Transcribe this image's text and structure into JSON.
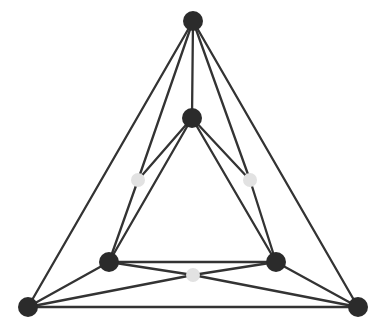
{
  "figure": {
    "width": 388,
    "height": 331,
    "background_color": "#ffffff"
  },
  "style": {
    "edge_color": "#333333",
    "edge_width": 2.3,
    "dark_vertex_color": "#2b2b2b",
    "light_vertex_color": "#e2e2e2",
    "light_vertex_stroke": "#d0d0d0",
    "dark_vertex_radius": 9.5,
    "light_vertex_radius": 7.0
  },
  "graph_data": {
    "type": "graph",
    "vertex_count": 9,
    "edge_count": 17,
    "vertices": [
      {
        "id": "apex",
        "label": "apex",
        "x": 193,
        "y": 21,
        "color": "dark",
        "radius": 10.0,
        "degree": 5
      },
      {
        "id": "inner-top",
        "label": "inner top",
        "x": 192,
        "y": 118,
        "color": "dark",
        "radius": 10.0,
        "degree": 5
      },
      {
        "id": "gray-left",
        "label": "left grey",
        "x": 138,
        "y": 180,
        "color": "light",
        "radius": 7.0,
        "degree": 2
      },
      {
        "id": "gray-right",
        "label": "right grey",
        "x": 250,
        "y": 180,
        "color": "light",
        "radius": 7.0,
        "degree": 2
      },
      {
        "id": "inner-left",
        "label": "inner lower left",
        "x": 109,
        "y": 262,
        "color": "dark",
        "radius": 10.0,
        "degree": 5
      },
      {
        "id": "inner-right",
        "label": "inner lower right",
        "x": 276,
        "y": 262,
        "color": "dark",
        "radius": 10.0,
        "degree": 5
      },
      {
        "id": "gray-bottom",
        "label": "bottom grey",
        "x": 193,
        "y": 275,
        "color": "light",
        "radius": 7.0,
        "degree": 2
      },
      {
        "id": "corner-left",
        "label": "bottom left",
        "x": 28,
        "y": 307,
        "color": "dark",
        "radius": 10.0,
        "degree": 5
      },
      {
        "id": "corner-right",
        "label": "bottom right",
        "x": 358,
        "y": 307,
        "color": "dark",
        "radius": 10.0,
        "degree": 5
      }
    ],
    "edges": [
      {
        "id": "e1",
        "from": "apex",
        "to": "corner-left"
      },
      {
        "id": "e2",
        "from": "apex",
        "to": "corner-right"
      },
      {
        "id": "e3",
        "from": "apex",
        "to": "inner-top"
      },
      {
        "id": "e4",
        "from": "apex",
        "to": "gray-left"
      },
      {
        "id": "e5",
        "from": "gray-left",
        "to": "inner-left"
      },
      {
        "id": "e6",
        "from": "apex",
        "to": "gray-right"
      },
      {
        "id": "e7",
        "from": "gray-right",
        "to": "inner-right"
      },
      {
        "id": "e8",
        "from": "inner-top",
        "to": "gray-left"
      },
      {
        "id": "e9",
        "from": "inner-top",
        "to": "gray-right"
      },
      {
        "id": "e10",
        "from": "inner-top",
        "to": "inner-left"
      },
      {
        "id": "e11",
        "from": "inner-top",
        "to": "inner-right"
      },
      {
        "id": "e12",
        "from": "inner-left",
        "to": "inner-right"
      },
      {
        "id": "e13",
        "from": "inner-left",
        "to": "corner-left"
      },
      {
        "id": "e14",
        "from": "inner-right",
        "to": "corner-right"
      },
      {
        "id": "e15",
        "from": "inner-left",
        "to": "gray-bottom"
      },
      {
        "id": "e16",
        "from": "gray-bottom",
        "to": "corner-right"
      },
      {
        "id": "e17",
        "from": "inner-right",
        "to": "gray-bottom"
      },
      {
        "id": "e18",
        "from": "gray-bottom",
        "to": "corner-left"
      },
      {
        "id": "e19",
        "from": "corner-left",
        "to": "corner-right"
      }
    ]
  }
}
